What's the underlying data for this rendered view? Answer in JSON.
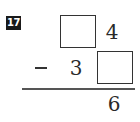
{
  "problem": {
    "number": "17",
    "top_row": {
      "tens": "",
      "ones": "4"
    },
    "bottom_row": {
      "operator": "−",
      "tens": "3",
      "ones": ""
    },
    "result": {
      "ones": "6"
    }
  }
}
